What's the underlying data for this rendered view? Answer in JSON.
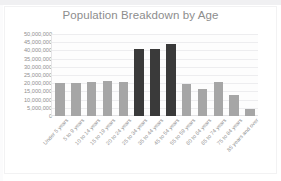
{
  "chart_data": {
    "type": "bar",
    "title": "Population Breakdown by Age",
    "xlabel": "",
    "ylabel": "",
    "ylim": [
      0,
      50000000
    ],
    "ytick_step": 5000000,
    "grid": true,
    "legend": "none",
    "categories": [
      "Under 5 years",
      "5 to 9 years",
      "10 to 14 years",
      "15 to 19 years",
      "20 to 24 years",
      "25 to 34 years",
      "35 to 44 years",
      "45 to 54 years",
      "55 to 59 years",
      "60 to 64 years",
      "65 to 74 years",
      "75 to 84 years",
      "85 years and over"
    ],
    "values": [
      20000000,
      20000000,
      20500000,
      21500000,
      21000000,
      41000000,
      41000000,
      44000000,
      19500000,
      16500000,
      21000000,
      13000000,
      4500000
    ],
    "ytick_labels": [
      "50,000,000",
      "45,000,000",
      "40,000,000",
      "35,000,000",
      "30,000,000",
      "25,000,000",
      "20,000,000",
      "15,000,000",
      "10,000,000",
      "5,000,000",
      "0"
    ],
    "bar_colors": [
      "#a6a6a6",
      "#a6a6a6",
      "#a6a6a6",
      "#a6a6a6",
      "#a6a6a6",
      "#3a3a3a",
      "#3a3a3a",
      "#3a3a3a",
      "#a6a6a6",
      "#a6a6a6",
      "#a6a6a6",
      "#a6a6a6",
      "#a6a6a6"
    ],
    "colors": {
      "normal_bar": "#a6a6a6",
      "highlight_bar": "#3a3a3a",
      "gridline": "#ededef",
      "title_text": "#8d8d8d",
      "tick_text": "#8f8f8f",
      "plot_background": "#fdfdfd",
      "canvas_background": "#ffffff"
    }
  }
}
